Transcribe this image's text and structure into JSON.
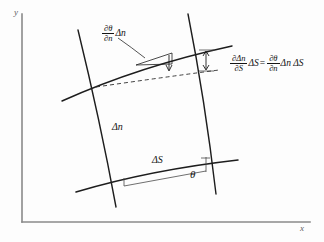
{
  "figure": {
    "type": "geometry-diagram",
    "background_color": "#fdfdfd",
    "ink_color": "#1d1d1d",
    "axis_color": "#8a8a8a"
  },
  "axes": {
    "x_label": "x",
    "y_label": "y",
    "origin": [
      22,
      222
    ],
    "x_end": [
      310,
      222
    ],
    "y_end": [
      22,
      14
    ]
  },
  "labels": {
    "slope_term": {
      "numerator": "∂θ",
      "denominator": "∂n",
      "trailing": "Δn"
    },
    "equation": {
      "left_numerator": "∂Δn",
      "left_denominator": "∂S",
      "left_trailing": "ΔS",
      "equals": "=",
      "right_numerator": "∂θ",
      "right_denominator": "∂n",
      "right_trailing": "Δn ΔS"
    },
    "normal_spacing": "Δn",
    "arc_length": "ΔS",
    "angle": "θ"
  },
  "geometry": {
    "upper_streamline": "M 62,101 Q 140,66 232,46",
    "lower_streamline": "M 76,192 Q 150,170 238,160",
    "left_normal": "M 78,30 Q 100,120 116,207",
    "right_normal": "M 188,14 Q 205,100 216,194",
    "dashed_tangent": "M 96,87 Q 160,77 216,69",
    "angle_baseline": "M 140,183 L 205,171",
    "angle_vertical": "M 205,171 L 205,157",
    "measure_arrow": "M 205,53 L 205,72",
    "leader_curve": "M 117,38 Q 132,48 147,56"
  }
}
